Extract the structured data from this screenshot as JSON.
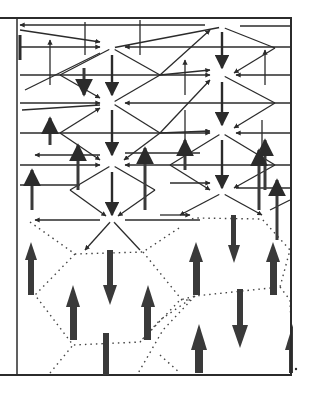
{
  "figure": {
    "colors": {
      "background": "#ffffff",
      "ink": "#2b2b2b",
      "thick_arrow": "#3a3a3a",
      "dots": "#444444"
    },
    "frame": {
      "left": 0,
      "top": 18,
      "right": 291,
      "bottom": 375,
      "inner_divider_x": 17
    },
    "hubs": [
      {
        "x": 112,
        "y": 48
      },
      {
        "x": 222,
        "y": 27
      },
      {
        "x": 112,
        "y": 103
      },
      {
        "x": 222,
        "y": 75
      },
      {
        "x": 112,
        "y": 165
      },
      {
        "x": 222,
        "y": 133
      },
      {
        "x": 222,
        "y": 193
      },
      {
        "x": 112,
        "y": 220
      }
    ],
    "large_arrows": [
      {
        "x": 31,
        "y1": 295,
        "y2": 242,
        "dir": "up"
      },
      {
        "x": 73,
        "y1": 340,
        "y2": 287,
        "dir": "up"
      },
      {
        "x": 148,
        "y1": 340,
        "y2": 287,
        "dir": "up"
      },
      {
        "x": 110,
        "y1": 250,
        "y2": 305,
        "dir": "down"
      },
      {
        "x": 196,
        "y1": 295,
        "y2": 243,
        "dir": "up"
      },
      {
        "x": 273,
        "y1": 295,
        "y2": 243,
        "dir": "up"
      },
      {
        "x": 234,
        "y1": 215,
        "y2": 262,
        "dir": "down"
      },
      {
        "x": 240,
        "y1": 290,
        "y2": 347,
        "dir": "down"
      },
      {
        "x": 199,
        "y1": 373,
        "y2": 325,
        "dir": "up"
      },
      {
        "x": 293,
        "y1": 373,
        "y2": 325,
        "dir": "up"
      },
      {
        "x": 106,
        "y1": 375,
        "y2": 333,
        "dir": "stem"
      }
    ]
  }
}
